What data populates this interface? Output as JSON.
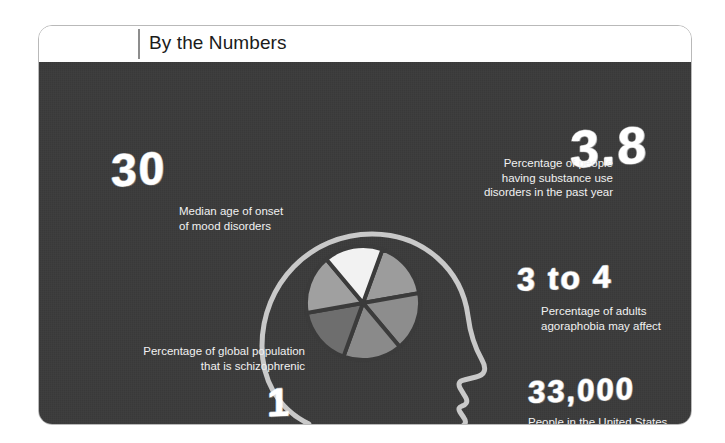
{
  "header": {
    "title": "By the Numbers",
    "divider": "vertical-rule"
  },
  "theme": {
    "page_background": "#ffffff",
    "panel_background": "#3b3b3b",
    "text_color": "#f1f1f1",
    "number_color": "#ffffff",
    "card_border": "#b9b9b9",
    "head_outline": "#c9c9c9"
  },
  "stats": [
    {
      "id": "median-age-onset",
      "value": "30",
      "caption": "Median age of onset\nof mood disorders"
    },
    {
      "id": "substance-use-disorders",
      "value": "3.8",
      "caption": "Percentage of people\nhaving substance use\ndisorders in the past year"
    },
    {
      "id": "agoraphobia-adults",
      "value": "3 to 4",
      "caption": "Percentage of adults\nagoraphobia may affect"
    },
    {
      "id": "suicides-per-year",
      "value": "33,000",
      "caption": "People in the  United States who\ntake their own lives each year"
    },
    {
      "id": "global-schizophrenia",
      "value": "1",
      "caption": "Percentage of global population\nthat is schizophrenic"
    }
  ],
  "chart_data": {
    "type": "pie",
    "title": "",
    "legend": "none",
    "labels": [
      "Slice 1",
      "Slice 2",
      "Slice 3",
      "Slice 4",
      "Slice 5",
      "Slice 6"
    ],
    "values": [
      16.7,
      16.7,
      16.7,
      16.7,
      16.7,
      16.7
    ],
    "colors": [
      "#9c9c9c",
      "#8d8d8d",
      "#8a8a8a",
      "#6e6e6e",
      "#a0a0a0",
      "#f2f2f2"
    ],
    "start_angle": -70,
    "gap_color": "#3b3b3b"
  },
  "figure": {
    "head_label": "head-silhouette-facing-right",
    "pie_label": "pie-chart-in-head"
  }
}
